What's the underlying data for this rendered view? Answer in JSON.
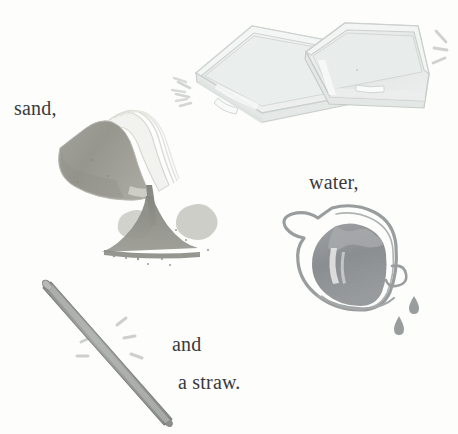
{
  "scene": {
    "kind": "watercolour-illustration",
    "title": "Materials illustration: sand, water, and a straw",
    "background_color": "#fdfdfc",
    "width": 458,
    "height": 434
  },
  "labels": {
    "sand": "sand,",
    "water": "water,",
    "and": "and",
    "straw": "a straw.",
    "text_color": "#3a3a3c"
  },
  "objects": [
    {
      "name": "plastic-container-left",
      "description": "translucent rectangular plastic tub, tilted, seen from above-left",
      "color": "#e9ebe9",
      "outline_color": "#cdd1cf"
    },
    {
      "name": "plastic-container-right",
      "description": "translucent rectangular plastic tub, upright, seen from above-right",
      "color": "#e7eae8",
      "outline_color": "#c9cecb"
    },
    {
      "name": "sand-bag",
      "description": "open paper bag of sand tipping over and pouring a cone of sand",
      "color": "#9a9a94",
      "outline_color": "#cfcfc9"
    },
    {
      "name": "sand-pile",
      "description": "cone-shaped pour of sand with scattered grains and pale splotches",
      "color": "#8f8f88",
      "splotch_color": "#c9cbc3"
    },
    {
      "name": "water-pitcher",
      "description": "sketchy jug of water with spout on the left and two falling drops",
      "color": "#8e9193",
      "outline_color": "#9a9d9e",
      "drop_color": "#9a9d9e"
    },
    {
      "name": "drinking-straw",
      "description": "grey drinking straw laid diagonally with motion sparkle marks",
      "color": "#9b9d9b",
      "outline_color": "#7e807e"
    }
  ],
  "sparkles": [
    {
      "name": "sparkle-left-of-containers",
      "count": 3
    },
    {
      "name": "sparkle-right-of-containers",
      "count": 3
    },
    {
      "name": "sparkle-above-sand-bag",
      "count": 3
    },
    {
      "name": "sparkle-near-straw",
      "count": 5
    }
  ]
}
